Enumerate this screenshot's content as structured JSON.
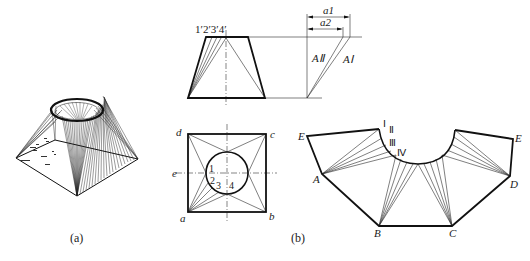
{
  "figure": {
    "subfigure_a": {
      "caption": "(a)",
      "description": "3D view of square-to-round transition piece (pyramid base with circular top opening)"
    },
    "subfigure_b": {
      "caption": "(b)",
      "front_view": {
        "top_point_labels": [
          "1′",
          "2′",
          "3′",
          "4′"
        ],
        "top_point_labels_text": "1′2′3′4′"
      },
      "true_length": {
        "dimension_labels": [
          "a1",
          "a2"
        ],
        "line_labels": [
          "AⅡ",
          "AⅠ"
        ]
      },
      "top_view": {
        "corner_labels": {
          "d": "d",
          "c": "c",
          "a": "a",
          "b": "b"
        },
        "side_label": "e",
        "circle_point_labels": [
          "1",
          "2",
          "3",
          "4"
        ]
      },
      "development": {
        "vertex_labels": {
          "E_left": "E",
          "E_right": "E",
          "A": "A",
          "B": "B",
          "C": "C",
          "D": "D"
        },
        "arc_point_labels": [
          "Ⅰ",
          "Ⅱ",
          "Ⅲ",
          "Ⅳ"
        ]
      }
    }
  }
}
